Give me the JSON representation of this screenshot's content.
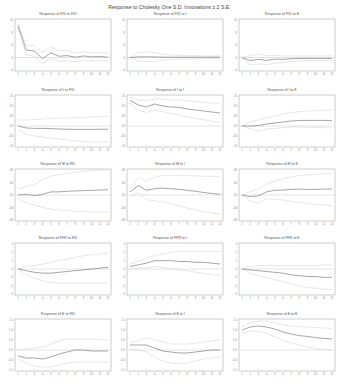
{
  "title": "Response to Cholesky One S.D. Innovations ± 2 S.E.",
  "chart_data": {
    "type": "line",
    "layout": "5x3 grid of impulse response panels",
    "x": [
      1,
      2,
      3,
      4,
      5,
      6,
      7,
      8,
      9,
      10,
      11,
      12
    ],
    "panels": [
      {
        "title": "Response of FID to FID",
        "ylim": [
          -4,
          12
        ],
        "yticks": [
          "12",
          "8",
          "4",
          "0",
          "-4"
        ],
        "response": [
          10.2,
          2.4,
          2.1,
          -0.4,
          1.5,
          0.4,
          0.6,
          0.1,
          0.5,
          0.2,
          0.3,
          0.1
        ],
        "upper": [
          10.8,
          4.0,
          3.8,
          1.6,
          3.5,
          2.2,
          2.2,
          1.6,
          1.8,
          1.5,
          1.6,
          1.3
        ],
        "lower": [
          9.6,
          0.8,
          0.4,
          -2.0,
          -0.3,
          -1.3,
          -1.0,
          -1.4,
          -0.9,
          -1.1,
          -1.0,
          -1.1
        ]
      },
      {
        "title": "Response of FID to I",
        "ylim": [
          -4,
          12
        ],
        "yticks": [
          "12",
          "8",
          "4",
          "0",
          "-4"
        ],
        "response": [
          0,
          0.2,
          0.2,
          0.2,
          0.1,
          0.1,
          0.1,
          0.1,
          0.1,
          0.1,
          0.1,
          0.1
        ],
        "upper": [
          0,
          1.6,
          1.8,
          1.6,
          1.0,
          0.8,
          0.7,
          0.6,
          0.6,
          0.5,
          0.5,
          0.5
        ],
        "lower": [
          0,
          -1.2,
          -1.4,
          -1.3,
          -0.9,
          -0.6,
          -0.5,
          -0.5,
          -0.4,
          -0.4,
          -0.4,
          -0.4
        ]
      },
      {
        "title": "Response of FID to E",
        "ylim": [
          -4,
          12
        ],
        "yticks": [
          "12",
          "8",
          "4",
          "0",
          "-4"
        ],
        "response": [
          0,
          -1.0,
          -0.6,
          -0.9,
          -0.5,
          -0.6,
          -0.4,
          -0.3,
          -0.3,
          -0.3,
          -0.3,
          -0.3
        ],
        "upper": [
          0,
          0.6,
          1.0,
          0.6,
          0.7,
          0.5,
          0.5,
          0.5,
          0.5,
          0.5,
          0.5,
          0.5
        ],
        "lower": [
          0,
          -2.4,
          -2.0,
          -2.3,
          -1.8,
          -1.6,
          -1.3,
          -1.1,
          -1.0,
          -1.0,
          -1.0,
          -1.0
        ]
      },
      {
        "title": "Response of I to FID",
        "ylim": [
          -0.1,
          0.15
        ],
        "yticks": [
          ".15",
          ".10",
          ".05",
          ".00",
          "-.05",
          "-.10"
        ],
        "response": [
          0,
          -0.01,
          -0.012,
          -0.012,
          -0.013,
          -0.015,
          -0.016,
          -0.017,
          -0.017,
          -0.017,
          -0.016,
          -0.016
        ],
        "upper": [
          0.03,
          0.03,
          0.032,
          0.035,
          0.038,
          0.04,
          0.04,
          0.042,
          0.043,
          0.045,
          0.047,
          0.048
        ],
        "lower": [
          -0.02,
          -0.04,
          -0.05,
          -0.055,
          -0.06,
          -0.065,
          -0.07,
          -0.075,
          -0.078,
          -0.08,
          -0.08,
          -0.08
        ]
      },
      {
        "title": "Response of I to I",
        "ylim": [
          -0.1,
          0.15
        ],
        "yticks": [
          ".15",
          ".10",
          ".05",
          ".00",
          "-.05",
          "-.10"
        ],
        "response": [
          0.13,
          0.105,
          0.095,
          0.11,
          0.1,
          0.095,
          0.093,
          0.085,
          0.08,
          0.075,
          0.07,
          0.065
        ],
        "upper": [
          0.145,
          0.13,
          0.125,
          0.135,
          0.135,
          0.13,
          0.13,
          0.125,
          0.122,
          0.118,
          0.115,
          0.11
        ],
        "lower": [
          0.115,
          0.08,
          0.068,
          0.078,
          0.072,
          0.063,
          0.055,
          0.045,
          0.038,
          0.032,
          0.025,
          0.018
        ]
      },
      {
        "title": "Response of I to E",
        "ylim": [
          -0.1,
          0.15
        ],
        "yticks": [
          ".15",
          ".10",
          ".05",
          ".00",
          "-.05",
          "-.10"
        ],
        "response": [
          0,
          0,
          0.002,
          0.01,
          0.015,
          0.02,
          0.025,
          0.028,
          0.028,
          0.028,
          0.028,
          0.028
        ],
        "upper": [
          0,
          0.02,
          0.03,
          0.04,
          0.05,
          0.06,
          0.068,
          0.072,
          0.075,
          0.077,
          0.078,
          0.08
        ],
        "lower": [
          0,
          -0.015,
          -0.025,
          -0.015,
          -0.012,
          -0.008,
          -0.005,
          -0.005,
          -0.006,
          -0.007,
          -0.008,
          -0.01
        ]
      },
      {
        "title": "Response of M to FID",
        "ylim": [
          -0.08,
          0.08
        ],
        "yticks": [
          ".08",
          ".04",
          ".00",
          "-.04",
          "-.08"
        ],
        "response": [
          0,
          0.002,
          -0.002,
          0.002,
          0.01,
          0.01,
          0.012,
          0.013,
          0.014,
          0.015,
          0.016,
          0.017
        ],
        "upper": [
          0.018,
          0.028,
          0.032,
          0.05,
          0.06,
          0.065,
          0.068,
          0.072,
          0.075,
          0.078,
          0.08,
          0.08
        ],
        "lower": [
          -0.01,
          -0.025,
          -0.032,
          -0.04,
          -0.045,
          -0.048,
          -0.05,
          -0.052,
          -0.053,
          -0.054,
          -0.055,
          -0.055
        ]
      },
      {
        "title": "Response of M to I",
        "ylim": [
          -0.08,
          0.08
        ],
        "yticks": [
          ".08",
          ".04",
          ".00",
          "-.04",
          "-.08"
        ],
        "response": [
          0.01,
          0.03,
          0.015,
          0.02,
          0.022,
          0.02,
          0.018,
          0.015,
          0.012,
          0.008,
          0.005,
          0.002
        ],
        "upper": [
          0.02,
          0.055,
          0.045,
          0.058,
          0.062,
          0.063,
          0.062,
          0.062,
          0.061,
          0.06,
          0.06,
          0.058
        ],
        "lower": [
          -0.005,
          0.008,
          -0.015,
          -0.018,
          -0.022,
          -0.028,
          -0.035,
          -0.042,
          -0.048,
          -0.053,
          -0.058,
          -0.062
        ]
      },
      {
        "title": "Response of M to E",
        "ylim": [
          -0.08,
          0.08
        ],
        "yticks": [
          ".08",
          ".04",
          ".00",
          "-.04",
          "-.08"
        ],
        "response": [
          0,
          -0.005,
          -0.003,
          0.01,
          0.015,
          0.016,
          0.018,
          0.019,
          0.018,
          0.018,
          0.019,
          0.019
        ],
        "upper": [
          0,
          0.01,
          0.02,
          0.035,
          0.045,
          0.052,
          0.058,
          0.062,
          0.064,
          0.066,
          0.068,
          0.07
        ],
        "lower": [
          0,
          -0.02,
          -0.025,
          -0.012,
          -0.014,
          -0.016,
          -0.02,
          -0.024,
          -0.028,
          -0.03,
          -0.032,
          -0.034
        ]
      },
      {
        "title": "Response of FFR to FID",
        "ylim": [
          -3,
          3
        ],
        "yticks": [
          "3",
          "2",
          "1",
          "0",
          "-1",
          "-2",
          "-3"
        ],
        "response": [
          0,
          -0.2,
          -0.4,
          -0.5,
          -0.5,
          -0.4,
          -0.3,
          -0.2,
          -0.1,
          0,
          0.1,
          0.2
        ],
        "upper": [
          0,
          0.3,
          0.4,
          0.6,
          0.8,
          1.0,
          1.2,
          1.4,
          1.6,
          1.7,
          1.8,
          1.9
        ],
        "lower": [
          0,
          -0.7,
          -1.1,
          -1.4,
          -1.6,
          -1.7,
          -1.7,
          -1.7,
          -1.7,
          -1.7,
          -1.7,
          -1.7
        ]
      },
      {
        "title": "Response of FFR to I",
        "ylim": [
          -3,
          3
        ],
        "yticks": [
          "3",
          "2",
          "1",
          "0",
          "-1",
          "-2",
          "-3"
        ],
        "response": [
          0.3,
          0.5,
          0.7,
          1.0,
          1.0,
          1.0,
          0.9,
          0.9,
          0.8,
          0.8,
          0.7,
          0.6
        ],
        "upper": [
          0.6,
          0.9,
          1.3,
          1.6,
          1.8,
          2.0,
          2.1,
          2.1,
          2.1,
          2.1,
          2.1,
          2.1
        ],
        "lower": [
          0,
          0.1,
          0.1,
          0.3,
          0.2,
          0.0,
          -0.1,
          -0.2,
          -0.4,
          -0.5,
          -0.7,
          -0.8
        ]
      },
      {
        "title": "Response of FFR to E",
        "ylim": [
          -3,
          3
        ],
        "yticks": [
          "3",
          "2",
          "1",
          "0",
          "-1",
          "-2",
          "-3"
        ],
        "response": [
          0,
          -0.1,
          -0.2,
          -0.3,
          -0.4,
          -0.5,
          -0.7,
          -0.8,
          -0.9,
          -0.9,
          -1.0,
          -1.0
        ],
        "upper": [
          0,
          0.3,
          0.4,
          0.4,
          0.4,
          0.4,
          0.4,
          0.4,
          0.4,
          0.4,
          0.5,
          0.5
        ],
        "lower": [
          0,
          -0.5,
          -0.8,
          -1.0,
          -1.3,
          -1.5,
          -1.8,
          -2.0,
          -2.2,
          -2.3,
          -2.4,
          -2.5
        ]
      },
      {
        "title": "Response of E to FID",
        "ylim": [
          -1.0,
          1.5
        ],
        "yticks": [
          "1.5",
          "1.0",
          "0.5",
          "0.0",
          "-0.5",
          "-1.0"
        ],
        "response": [
          -0.3,
          -0.4,
          -0.4,
          -0.45,
          -0.35,
          -0.2,
          -0.1,
          0,
          0,
          -0.05,
          -0.05,
          -0.05
        ],
        "upper": [
          0,
          0.05,
          0.1,
          0.15,
          0.3,
          0.45,
          0.55,
          0.55,
          0.55,
          0.55,
          0.52,
          0.5
        ],
        "lower": [
          -0.45,
          -0.65,
          -0.8,
          -0.85,
          -0.85,
          -0.75,
          -0.65,
          -0.6,
          -0.6,
          -0.6,
          -0.6,
          -0.6
        ]
      },
      {
        "title": "Response of E to I",
        "ylim": [
          -1.0,
          1.5
        ],
        "yticks": [
          "1.5",
          "1.0",
          "0.5",
          "0.0",
          "-0.5",
          "-1.0"
        ],
        "response": [
          0.25,
          0.25,
          0.25,
          0.1,
          -0.05,
          -0.1,
          -0.15,
          -0.15,
          -0.1,
          -0.05,
          0,
          0
        ],
        "upper": [
          0.35,
          0.45,
          0.6,
          0.5,
          0.4,
          0.3,
          0.3,
          0.3,
          0.35,
          0.4,
          0.45,
          0.5
        ],
        "lower": [
          0.05,
          0,
          -0.1,
          -0.35,
          -0.55,
          -0.65,
          -0.7,
          -0.65,
          -0.55,
          -0.45,
          -0.4,
          -0.35
        ]
      },
      {
        "title": "Response of E to E",
        "ylim": [
          -1.0,
          1.5
        ],
        "yticks": [
          "1.5",
          "1.0",
          "0.5",
          "0.0",
          "-0.5",
          "-1.0"
        ],
        "response": [
          1.0,
          1.15,
          1.2,
          1.15,
          1.05,
          0.9,
          0.8,
          0.72,
          0.68,
          0.62,
          0.58,
          0.55
        ],
        "upper": [
          1.15,
          1.35,
          1.45,
          1.45,
          1.35,
          1.25,
          1.2,
          1.17,
          1.15,
          1.12,
          1.1,
          1.08
        ],
        "lower": [
          0.85,
          0.95,
          0.95,
          0.85,
          0.65,
          0.5,
          0.35,
          0.25,
          0.15,
          0.08,
          0.02,
          0.0
        ]
      }
    ]
  }
}
